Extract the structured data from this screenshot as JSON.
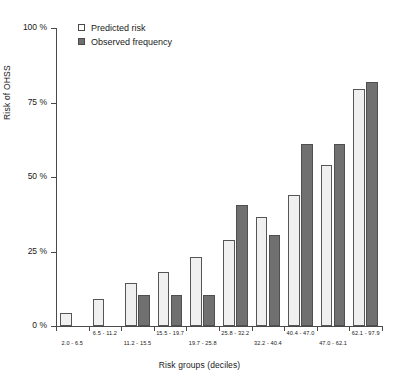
{
  "chart_data": {
    "type": "bar",
    "title": "",
    "xlabel": "Risk groups (deciles)",
    "ylabel": "Risk of OHSS",
    "ylim": [
      0,
      100
    ],
    "yticks": [
      0,
      25,
      50,
      75,
      100
    ],
    "ytick_labels": [
      "0 %",
      "25 %",
      "50 %",
      "75 %",
      "100 %"
    ],
    "grid": false,
    "legend_position": "top-left",
    "categories": [
      "2.0 - 6.5",
      "6.5 - 11.2",
      "11.2 - 15.5",
      "15.5 - 19.7",
      "19.7 - 25.8",
      "25.8 - 32.2",
      "32.2 - 40.4",
      "40.4 - 47.0",
      "47.0 - 62.1",
      "62.1 - 97.9"
    ],
    "series": [
      {
        "name": "Predicted risk",
        "color": "#f0f0f0",
        "values": [
          4.3,
          9.0,
          14.5,
          18.0,
          23.0,
          29.0,
          36.5,
          44.0,
          54.0,
          79.5
        ]
      },
      {
        "name": "Observed frequency",
        "color": "#707070",
        "values": [
          0.0,
          0.0,
          10.5,
          10.5,
          10.5,
          40.5,
          30.5,
          61.0,
          61.0,
          82.0
        ]
      }
    ]
  },
  "legend": {
    "items": [
      {
        "label": "Predicted risk",
        "swatch": "predicted"
      },
      {
        "label": "Observed frequency",
        "swatch": "observed"
      }
    ]
  }
}
